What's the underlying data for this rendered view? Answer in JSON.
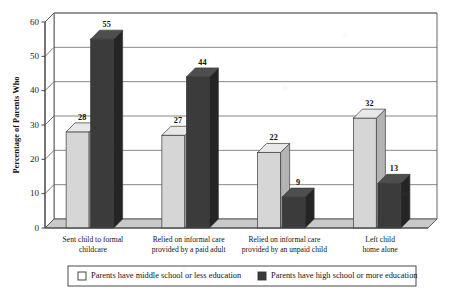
{
  "chart_data": {
    "type": "bar",
    "title": "",
    "subtitle": "",
    "xlabel": "",
    "ylabel": "Percentage of Parents Who",
    "ylim": [
      0,
      60
    ],
    "ytick_step": 10,
    "yticks": [
      "0",
      "10",
      "20",
      "30",
      "40",
      "50",
      "60"
    ],
    "grid": true,
    "legend_position": "bottom",
    "style": "3d-grouped-bar",
    "categories": [
      "Sent child to formal childcare",
      "Relied on informal care provided by a paid adult",
      "Relied on informal care provided by an unpaid child",
      "Left child home alone"
    ],
    "category_lines": [
      [
        "Sent child to formal",
        "childcare"
      ],
      [
        "Relied on informal care",
        "provided by a paid adult"
      ],
      [
        "Relied on informal care",
        "provided by an unpaid child"
      ],
      [
        "Left child",
        "home alone"
      ]
    ],
    "series": [
      {
        "name": "Parents have middle school or less education",
        "color": "#d6d6d6",
        "values": [
          28,
          27,
          22,
          32
        ]
      },
      {
        "name": "Parents have high school or more education",
        "color": "#3b3b3b",
        "values": [
          55,
          44,
          9,
          13
        ]
      }
    ]
  },
  "legend": {
    "items": [
      {
        "label": "Parents have middle school or less education",
        "swatch": "#ffffff"
      },
      {
        "label": "Parents have high school or more education",
        "swatch": "#3b3b3b"
      }
    ]
  }
}
